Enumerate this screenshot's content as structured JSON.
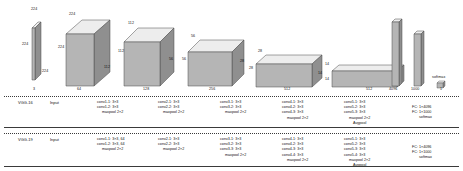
{
  "figure": {
    "type": "neural-network-architecture",
    "networks": [
      "VGG-16",
      "VGG-19"
    ]
  },
  "blocks": [
    {
      "id": "input-plane",
      "name": "input",
      "channels": "3",
      "dim_top": "224",
      "dim_left": "224",
      "dim_right": "224"
    },
    {
      "id": "conv1-block",
      "name": "conv1",
      "channels": "64",
      "dim_top": "224",
      "dim_left": "224",
      "dim_right": "112"
    },
    {
      "id": "conv2-block",
      "name": "conv2",
      "channels": "128",
      "dim_top": "112",
      "dim_left": "112",
      "dim_right": "56"
    },
    {
      "id": "conv3-block",
      "name": "conv3",
      "channels": "256",
      "dim_top": "56",
      "dim_left": "56",
      "dim_right": "28"
    },
    {
      "id": "conv4-block",
      "name": "conv4",
      "channels": "512",
      "dim_top": "28",
      "dim_left": "28",
      "dim_right": "14"
    },
    {
      "id": "conv5-block",
      "name": "conv5",
      "channels": "512",
      "dim_top": "14",
      "dim_left": "14",
      "dim_right": "7"
    },
    {
      "id": "fc1-bar",
      "name": "fc1",
      "channels": "4096"
    },
    {
      "id": "fc2-bar",
      "name": "fc2",
      "channels": "1000"
    },
    {
      "id": "softmax-bar",
      "name": "softmax",
      "channels": "1",
      "label": "softmax"
    }
  ],
  "rows": [
    {
      "network": "VGG-16",
      "stages": [
        {
          "id": "input",
          "lines": [
            "Input"
          ]
        },
        {
          "id": "conv1",
          "lines": [
            "conv1-1:  3×3",
            "conv1-2:  3×3"
          ],
          "pool": "maxpool 2×2"
        },
        {
          "id": "conv2",
          "lines": [
            "conv2-1:  3×3",
            "conv2-2:  3×3"
          ],
          "pool": "maxpool 2×2"
        },
        {
          "id": "conv3",
          "lines": [
            "conv3-1:  3×3",
            "conv3-2:  3×3"
          ],
          "pool": "maxpool 2×2"
        },
        {
          "id": "conv4",
          "lines": [
            "conv4-1:  3×3",
            "conv4-2:  3×3",
            "conv4-3:  3×3"
          ],
          "pool": "maxpool 2×2"
        },
        {
          "id": "conv5",
          "lines": [
            "conv5-1:  3×3",
            "conv5-2:  3×3",
            "conv5-3:  3×3"
          ],
          "pool": "maxpool 2×2",
          "extra": "Avgpool"
        },
        {
          "id": "fc",
          "lines": [
            "FC:  1×4096",
            "FC:  1×1000"
          ],
          "extra": "softmax"
        }
      ]
    },
    {
      "network": "VGG-19",
      "stages": [
        {
          "id": "input",
          "lines": [
            "Input"
          ]
        },
        {
          "id": "conv1",
          "lines": [
            "conv1-1:  3×3, 64",
            "conv1-2:  3×3, 64"
          ],
          "pool": "maxpool 2×2"
        },
        {
          "id": "conv2",
          "lines": [
            "conv2-1:  3×3",
            "conv2-2:  3×3"
          ],
          "pool": "maxpool 2×2"
        },
        {
          "id": "conv3",
          "lines": [
            "conv3-1:  3×3",
            "conv3-2:  3×3",
            "conv3-3:  3×3"
          ],
          "pool": "maxpool 2×2"
        },
        {
          "id": "conv4",
          "lines": [
            "conv4-1:  3×3",
            "conv4-2:  3×3",
            "conv4-3:  3×3",
            "conv4-4:  3×3"
          ],
          "pool": "maxpool 2×2"
        },
        {
          "id": "conv5",
          "lines": [
            "conv5-1:  3×3",
            "conv5-2:  3×3",
            "conv5-3:  3×3",
            "conv5-4:  3×3"
          ],
          "pool": "maxpool 2×2",
          "extra": "Avgpool"
        },
        {
          "id": "fc",
          "lines": [
            "FC:  1×4096",
            "FC:  1×1000"
          ],
          "extra": "softmax"
        }
      ]
    }
  ],
  "colors": {
    "face_front": "#b5b5b5",
    "face_top": "#ededed",
    "face_side": "#8f8f8f",
    "stroke": "#4a4a4a",
    "rule": "#3a3a3a",
    "text": "#111111"
  }
}
